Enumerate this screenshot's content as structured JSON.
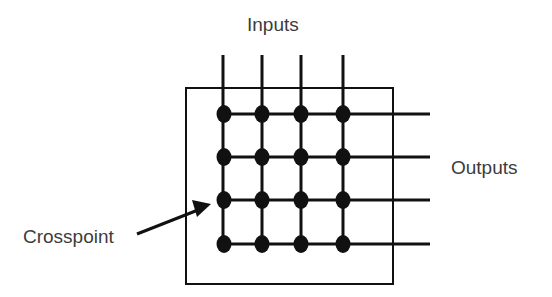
{
  "labels": {
    "inputs": "Inputs",
    "outputs": "Outputs",
    "crosspoint": "Crosspoint"
  },
  "diagram": {
    "type": "crossbar-switch",
    "rows": 4,
    "columns": 4,
    "crosspoints": 16,
    "colors": {
      "line": "#111111",
      "text": "#3c3c3c",
      "background": "#ffffff"
    }
  }
}
